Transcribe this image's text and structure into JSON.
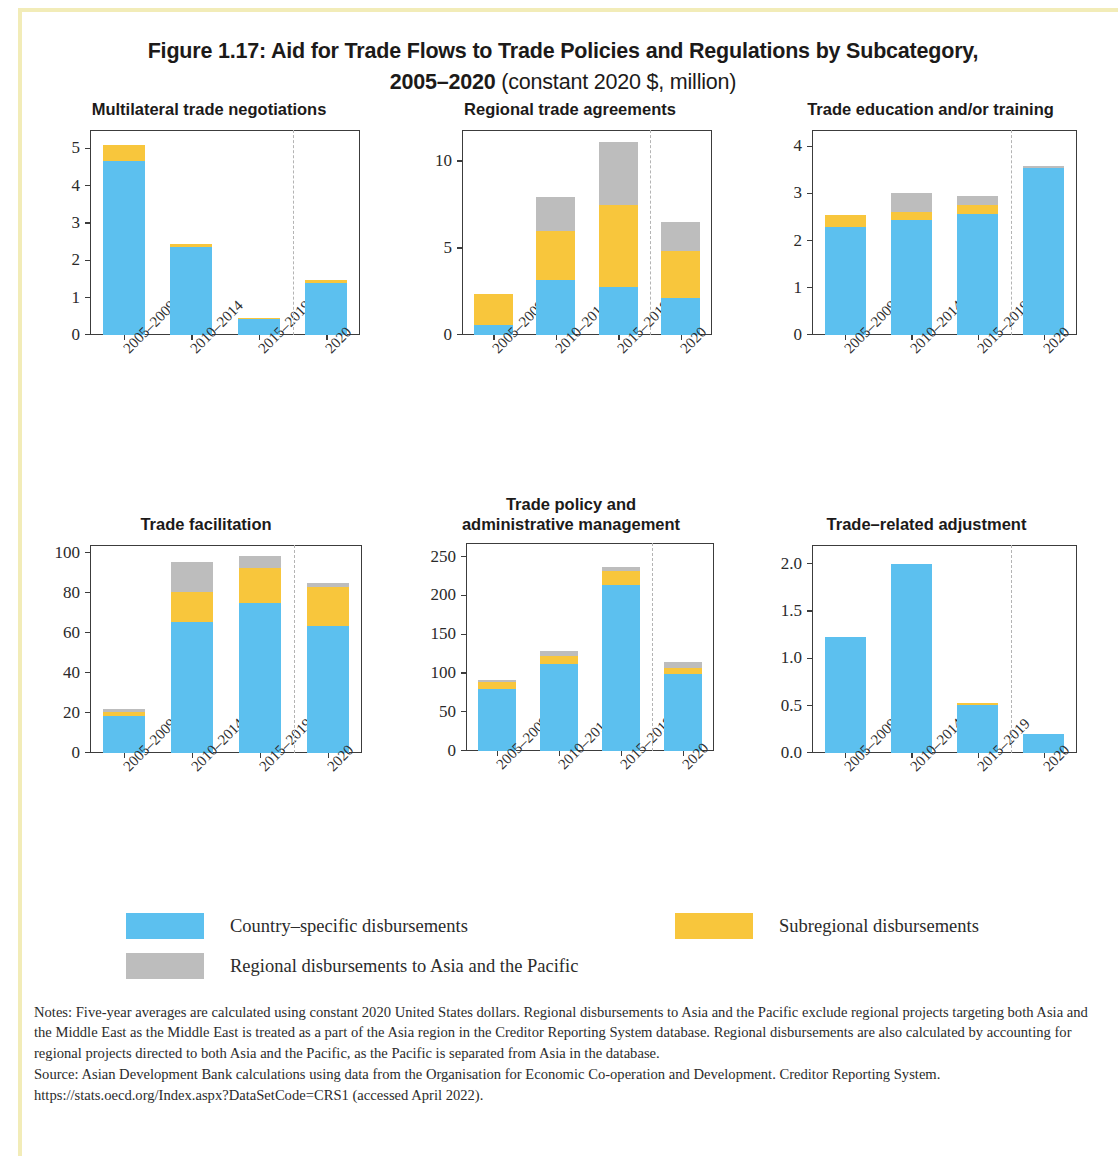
{
  "figure": {
    "title_line1": "Figure 1.17: Aid for Trade Flows to Trade Policies and Regulations by Subcategory,",
    "title_line2_bold": "2005–2020",
    "title_line2_regular": " (constant 2020 $, million)"
  },
  "legend": {
    "items": [
      {
        "key": "blue",
        "label": "Country–specific disbursements",
        "color": "#5cc0ef"
      },
      {
        "key": "yellow",
        "label": "Subregional disbursements",
        "color": "#f8c63c"
      },
      {
        "key": "gray",
        "label": "Regional disbursements to Asia and the Pacific",
        "color": "#bdbdbd"
      }
    ]
  },
  "notes": {
    "notes_text": "Notes: Five-year averages are calculated using constant 2020 United States dollars. Regional disbursements to Asia and the Pacific exclude regional projects targeting both Asia and the Middle East as the Middle East is treated as a part of the Asia region in the Creditor Reporting System database. Regional disbursements are also calculated by accounting for regional projects directed to both Asia and the Pacific, as the Pacific is separated from Asia in the database.",
    "source_text": "Source: Asian Development Bank calculations using data from the Organisation for Economic Co-operation and Development. Creditor Reporting System. https://stats.oecd.org/Index.aspx?DataSetCode=CRS1 (accessed April 2022)."
  },
  "chart_data": [
    {
      "id": "multilateral-trade-negotiations",
      "type": "bar",
      "stacked": true,
      "title": "Multilateral trade negotiations",
      "xlabel": "",
      "ylabel": "",
      "categories": [
        "2005–2009",
        "2010–2014",
        "2015–2019",
        "2020"
      ],
      "yticks": [
        0,
        1,
        2,
        3,
        4,
        5
      ],
      "ytick_labels": [
        "0",
        "1",
        "2",
        "3",
        "4",
        "5"
      ],
      "ylim": [
        0,
        5.5
      ],
      "divider_after_index": 2,
      "series": [
        {
          "name": "Country-specific disbursements",
          "color": "#5cc0ef",
          "values": [
            4.65,
            2.36,
            0.42,
            1.38
          ]
        },
        {
          "name": "Subregional disbursements",
          "color": "#f8c63c",
          "values": [
            0.44,
            0.08,
            0.04,
            0.09
          ]
        },
        {
          "name": "Regional disbursements to Asia and the Pacific",
          "color": "#bdbdbd",
          "values": [
            0.0,
            0.0,
            0.0,
            0.0
          ]
        }
      ],
      "totals": [
        5.09,
        2.44,
        0.46,
        1.47
      ]
    },
    {
      "id": "regional-trade-agreements",
      "type": "bar",
      "stacked": true,
      "title": "Regional trade agreements",
      "xlabel": "",
      "ylabel": "",
      "categories": [
        "2005–2009",
        "2010–2014",
        "2015–2019",
        "2020"
      ],
      "yticks": [
        0,
        5,
        10
      ],
      "ytick_labels": [
        "0",
        "5",
        "10"
      ],
      "ylim": [
        0,
        11.8
      ],
      "divider_after_index": 2,
      "series": [
        {
          "name": "Country-specific disbursements",
          "color": "#5cc0ef",
          "values": [
            0.55,
            3.15,
            2.75,
            2.1
          ]
        },
        {
          "name": "Subregional disbursements",
          "color": "#f8c63c",
          "values": [
            1.8,
            2.85,
            4.7,
            2.7
          ]
        },
        {
          "name": "Regional disbursements to Asia and the Pacific",
          "color": "#bdbdbd",
          "values": [
            0.0,
            1.95,
            3.65,
            1.7
          ]
        }
      ],
      "totals": [
        2.35,
        7.95,
        11.1,
        6.5
      ]
    },
    {
      "id": "trade-education-and-or-training",
      "type": "bar",
      "stacked": true,
      "title": "Trade education and/or training",
      "xlabel": "",
      "ylabel": "",
      "categories": [
        "2005–2009",
        "2010–2014",
        "2015–2019",
        "2020"
      ],
      "yticks": [
        0,
        1,
        2,
        3,
        4
      ],
      "ytick_labels": [
        "0",
        "1",
        "2",
        "3",
        "4"
      ],
      "ylim": [
        0,
        4.35
      ],
      "divider_after_index": 2,
      "series": [
        {
          "name": "Country-specific disbursements",
          "color": "#5cc0ef",
          "values": [
            2.28,
            2.44,
            2.56,
            3.54
          ]
        },
        {
          "name": "Subregional disbursements",
          "color": "#f8c63c",
          "values": [
            0.26,
            0.17,
            0.19,
            0.0
          ]
        },
        {
          "name": "Regional disbursements to Asia and the Pacific",
          "color": "#bdbdbd",
          "values": [
            0.0,
            0.39,
            0.2,
            0.04
          ]
        }
      ],
      "totals": [
        2.54,
        3.0,
        2.95,
        3.58
      ]
    },
    {
      "id": "trade-facilitation",
      "type": "bar",
      "stacked": true,
      "title": "Trade facilitation",
      "xlabel": "",
      "ylabel": "",
      "categories": [
        "2005–2009",
        "2010–2014",
        "2015–2019",
        "2020"
      ],
      "yticks": [
        0,
        20,
        40,
        60,
        80,
        100
      ],
      "ytick_labels": [
        "0",
        "20",
        "40",
        "60",
        "80",
        "100"
      ],
      "ylim": [
        0,
        104
      ],
      "divider_after_index": 2,
      "series": [
        {
          "name": "Country-specific disbursements",
          "color": "#5cc0ef",
          "values": [
            18.6,
            65.5,
            75.0,
            63.5
          ]
        },
        {
          "name": "Subregional disbursements",
          "color": "#f8c63c",
          "values": [
            1.6,
            15.0,
            17.5,
            19.5
          ]
        },
        {
          "name": "Regional disbursements to Asia and the Pacific",
          "color": "#bdbdbd",
          "values": [
            1.8,
            15.0,
            5.8,
            2.0
          ]
        }
      ],
      "totals": [
        22.0,
        95.5,
        98.3,
        85.0
      ]
    },
    {
      "id": "trade-policy-and-administrative-management",
      "type": "bar",
      "stacked": true,
      "title_line1": "Trade policy and",
      "title_line2": "administrative management",
      "title": "Trade policy and administrative management",
      "xlabel": "",
      "ylabel": "",
      "categories": [
        "2005–2009",
        "2010–2014",
        "2015–2019",
        "2020"
      ],
      "yticks": [
        0,
        50,
        100,
        150,
        200,
        250
      ],
      "ytick_labels": [
        "0",
        "50",
        "100",
        "150",
        "200",
        "250"
      ],
      "ylim": [
        0,
        268
      ],
      "divider_after_index": 2,
      "series": [
        {
          "name": "Country-specific disbursements",
          "color": "#5cc0ef",
          "values": [
            80.0,
            112.0,
            213.0,
            99.0
          ]
        },
        {
          "name": "Subregional disbursements",
          "color": "#f8c63c",
          "values": [
            8.0,
            10.0,
            18.0,
            7.0
          ]
        },
        {
          "name": "Regional disbursements to Asia and the Pacific",
          "color": "#bdbdbd",
          "values": [
            3.0,
            7.0,
            5.0,
            8.0
          ]
        }
      ],
      "totals": [
        91.0,
        129.0,
        236.0,
        114.0
      ]
    },
    {
      "id": "trade-related-adjustment",
      "type": "bar",
      "stacked": true,
      "title": "Trade–related adjustment",
      "xlabel": "",
      "ylabel": "",
      "categories": [
        "2005–2009",
        "2010–2014",
        "2015–2019",
        "2020"
      ],
      "yticks": [
        0.0,
        0.5,
        1.0,
        1.5,
        2.0
      ],
      "ytick_labels": [
        "0.0",
        "0.5",
        "1.0",
        "1.5",
        "2.0"
      ],
      "ylim": [
        0,
        2.2
      ],
      "divider_after_index": 2,
      "series": [
        {
          "name": "Country-specific disbursements",
          "color": "#5cc0ef",
          "values": [
            1.22,
            2.0,
            0.51,
            0.2
          ]
        },
        {
          "name": "Subregional disbursements",
          "color": "#f8c63c",
          "values": [
            0.0,
            0.0,
            0.02,
            0.0
          ]
        },
        {
          "name": "Regional disbursements to Asia and the Pacific",
          "color": "#bdbdbd",
          "values": [
            0.0,
            0.0,
            0.0,
            0.0
          ]
        }
      ],
      "totals": [
        1.22,
        2.0,
        0.53,
        0.2
      ]
    }
  ]
}
